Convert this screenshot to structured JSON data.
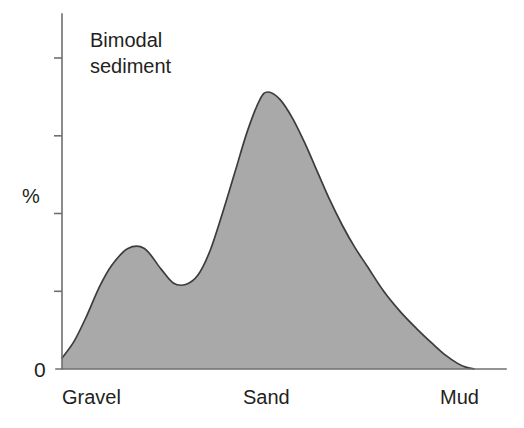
{
  "chart_data": {
    "type": "area",
    "title": "Bimodal sediment",
    "title_line1": "Bimodal",
    "title_line2": "sediment",
    "xlabel": "",
    "ylabel": "%",
    "grid": false,
    "legend": "none",
    "axis_origin_label": "0",
    "x_categories": [
      "Gravel",
      "Sand",
      "Mud"
    ],
    "x_category_positions": [
      0.0,
      0.5,
      0.95
    ],
    "xlim": [
      0,
      1
    ],
    "ylim": [
      0,
      100
    ],
    "y_tick_count": 5,
    "y_tick_values": [
      0,
      25,
      50,
      75,
      100
    ],
    "y_tick_labels": [
      "0",
      "",
      "",
      "",
      ""
    ],
    "colors": {
      "fill": "#a9a9a9",
      "outline": "#3c3c3c",
      "axis": "#6f6f6f",
      "text": "#231f20",
      "background": "#ffffff"
    },
    "x": [
      0.0,
      0.03,
      0.06,
      0.09,
      0.12,
      0.16,
      0.2,
      0.24,
      0.27,
      0.3,
      0.33,
      0.36,
      0.39,
      0.42,
      0.45,
      0.48,
      0.5,
      0.53,
      0.56,
      0.59,
      0.62,
      0.65,
      0.68,
      0.71,
      0.74,
      0.78,
      0.82,
      0.86,
      0.9,
      0.93,
      0.96,
      0.98,
      1.0
    ],
    "y": [
      3.5,
      9.0,
      17.0,
      26.0,
      33.0,
      38.5,
      38.5,
      32.0,
      27.5,
      27.0,
      30.0,
      38.0,
      50.0,
      63.0,
      76.0,
      86.0,
      88.5,
      86.0,
      80.0,
      72.0,
      63.0,
      54.0,
      46.0,
      39.0,
      33.0,
      25.0,
      18.5,
      13.0,
      8.0,
      4.5,
      1.8,
      0.6,
      0.0
    ],
    "peaks": [
      {
        "name": "gravel-mode",
        "x": 0.18,
        "y": 38.5
      },
      {
        "name": "sand-mode",
        "x": 0.505,
        "y": 88.5
      }
    ],
    "trough": {
      "name": "inter-mode-minimum",
      "x": 0.305,
      "y": 27.0
    }
  },
  "figure": {
    "title_line1": "Bimodal",
    "title_line2": "sediment",
    "ylabel": "%",
    "zero_label": "0",
    "x_labels": {
      "left": "Gravel",
      "middle": "Sand",
      "right": "Mud"
    }
  }
}
